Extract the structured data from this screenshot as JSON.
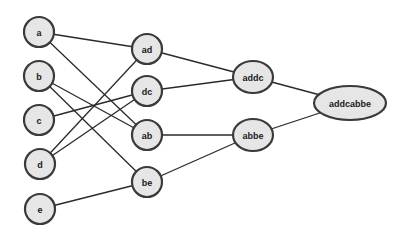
{
  "diagram": {
    "type": "merge-tree",
    "nodes": [
      {
        "id": "a",
        "label": "a",
        "x": 39,
        "y": 32,
        "rx": 15,
        "ry": 15
      },
      {
        "id": "b",
        "label": "b",
        "x": 39,
        "y": 76,
        "rx": 15,
        "ry": 15
      },
      {
        "id": "c",
        "label": "c",
        "x": 39,
        "y": 120,
        "rx": 15,
        "ry": 15
      },
      {
        "id": "d",
        "label": "d",
        "x": 40,
        "y": 164,
        "rx": 15,
        "ry": 15
      },
      {
        "id": "e",
        "label": "e",
        "x": 40,
        "y": 209,
        "rx": 15,
        "ry": 15
      },
      {
        "id": "ad",
        "label": "ad",
        "x": 147,
        "y": 49,
        "rx": 15,
        "ry": 15
      },
      {
        "id": "dc",
        "label": "dc",
        "x": 147,
        "y": 91,
        "rx": 15,
        "ry": 15
      },
      {
        "id": "ab",
        "label": "ab",
        "x": 147,
        "y": 135,
        "rx": 15,
        "ry": 15
      },
      {
        "id": "be",
        "label": "be",
        "x": 147,
        "y": 182,
        "rx": 15,
        "ry": 15
      },
      {
        "id": "addc",
        "label": "addc",
        "x": 253,
        "y": 77,
        "rx": 20,
        "ry": 16
      },
      {
        "id": "abbe",
        "label": "abbe",
        "x": 253,
        "y": 135,
        "rx": 20,
        "ry": 16
      },
      {
        "id": "addcabbe",
        "label": "addcabbe",
        "x": 350,
        "y": 103,
        "rx": 36,
        "ry": 17
      }
    ],
    "edges": [
      {
        "from": "a",
        "to": "ad"
      },
      {
        "from": "a",
        "to": "ab"
      },
      {
        "from": "b",
        "to": "ab"
      },
      {
        "from": "b",
        "to": "be"
      },
      {
        "from": "c",
        "to": "dc"
      },
      {
        "from": "d",
        "to": "ad"
      },
      {
        "from": "d",
        "to": "dc"
      },
      {
        "from": "e",
        "to": "be"
      },
      {
        "from": "ad",
        "to": "addc"
      },
      {
        "from": "dc",
        "to": "addc"
      },
      {
        "from": "ab",
        "to": "abbe"
      },
      {
        "from": "be",
        "to": "abbe"
      },
      {
        "from": "addc",
        "to": "addcabbe"
      },
      {
        "from": "abbe",
        "to": "addcabbe"
      }
    ]
  },
  "colors": {
    "node_fill": "#e6e6e6",
    "node_stroke": "#3a3a3a",
    "edge": "#2a2a2a",
    "background": "#ffffff"
  }
}
